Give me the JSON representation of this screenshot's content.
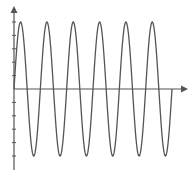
{
  "chart_data": {
    "type": "line",
    "title": "",
    "xlabel": "",
    "ylabel": "",
    "function": "y = 5*sin(2*pi*x)",
    "amplitude": 5,
    "periods": 6,
    "x": [
      0,
      0.25,
      0.5,
      0.75,
      1,
      1.25,
      1.5,
      1.75,
      2,
      2.25,
      2.5,
      2.75,
      3,
      3.25,
      3.5,
      3.75,
      4,
      4.25,
      4.5,
      4.75,
      5,
      5.25,
      5.5,
      5.75,
      6
    ],
    "series": [
      {
        "name": "sine wave",
        "values": [
          0,
          5,
          0,
          -5,
          0,
          5,
          0,
          -5,
          0,
          5,
          0,
          -5,
          0,
          5,
          0,
          -5,
          0,
          5,
          0,
          -5,
          0,
          5,
          0,
          -5,
          0
        ]
      }
    ],
    "xlim": [
      0,
      6.5
    ],
    "ylim": [
      -6,
      6
    ],
    "y_ticks": [
      -5,
      -4,
      -3,
      -2,
      -1,
      1,
      2,
      3,
      4,
      5
    ],
    "x_ticks": [],
    "tick_labels_shown": false,
    "grid": false,
    "legend": null,
    "axes_style": "arrows through origin",
    "colors": {
      "line": "#555555",
      "axes": "#555555",
      "background": "#ffffff"
    }
  }
}
